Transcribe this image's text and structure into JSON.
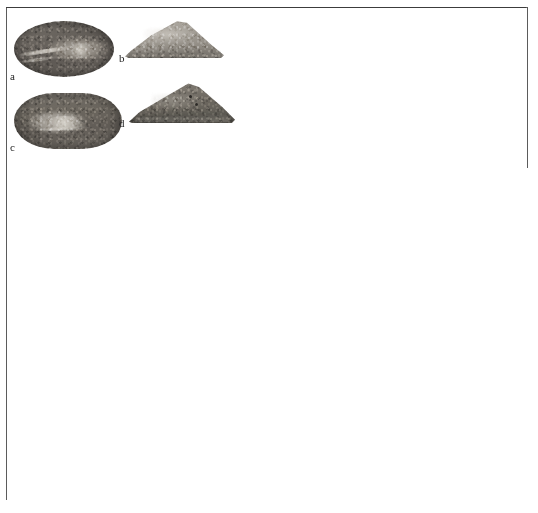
{
  "plate": {
    "background_color": "#ffffff",
    "frame": {
      "border_color": "#5b5b5b",
      "fill_color": "#ffffff"
    }
  },
  "figure": {
    "caption": "",
    "specimens": [
      {
        "label": "a",
        "icon": "bivalve-valve-oval-photo",
        "view": "oval valve, exterior",
        "tone": "dark grey-brown",
        "shape": "oval",
        "colors": {
          "base": "#6a655f",
          "highlight": "#a9a49c",
          "shadow": "#3f3b37"
        }
      },
      {
        "label": "b",
        "icon": "bivalve-valve-triangular-photo",
        "view": "triangular valve, profile",
        "tone": "pale grey",
        "shape": "triangular",
        "colors": {
          "base": "#a8a39b",
          "highlight": "#dedad3",
          "shadow": "#78736c"
        }
      },
      {
        "label": "c",
        "icon": "bivalve-valve-rounded-rect-photo",
        "view": "rounded rectangular valve, interior",
        "tone": "medium grey",
        "shape": "rounded-rectangular",
        "colors": {
          "base": "#6c675f",
          "highlight": "#d8d4cc",
          "shadow": "#3d3935"
        }
      },
      {
        "label": "d",
        "icon": "bivalve-valve-triangular-dark-photo",
        "view": "triangular valve, profile",
        "tone": "dark grey",
        "shape": "triangular",
        "colors": {
          "base": "#7b766e",
          "highlight": "#c4c0b8",
          "shadow": "#2c2a27"
        }
      }
    ]
  },
  "blank_area": {
    "note": ""
  }
}
